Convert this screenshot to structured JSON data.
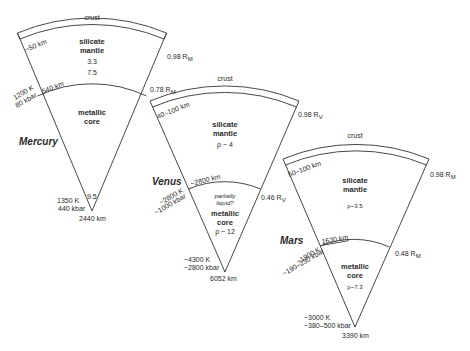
{
  "diagram": {
    "stroke_color": "#333333",
    "mercury": {
      "name": "Mercury",
      "crust_label": "crust",
      "crust_thickness": "~50 km",
      "mantle_label_1": "silicate",
      "mantle_label_2": "mantle",
      "mantle_density": "3.3",
      "core_density": "7.5",
      "mantle_core_depth": "540 km",
      "crust_radius": "0.98 R",
      "crust_radius_sub": "M",
      "core_radius": "0.78 R",
      "core_radius_sub": "M",
      "cmb_temp": "1200 K",
      "cmb_pressure": "80 kbar",
      "core_label_1": "metallic",
      "core_label_2": "core",
      "center_density": "9.5",
      "center_temp": "1350 K",
      "center_pressure": "440 kbar",
      "radius": "2440 km"
    },
    "venus": {
      "name": "Venus",
      "crust_label": "crust",
      "crust_thickness": "40–100 km",
      "crust_radius": "0.98 R",
      "crust_radius_sub": "V",
      "mantle_label_1": "silicate",
      "mantle_label_2": "mantle",
      "mantle_density": "ρ ~ 4",
      "mantle_core_depth": "~2800 km",
      "cmb_temp": "~2800 K",
      "cmb_pressure": "~1000 kbar",
      "core_radius": "0.46 R",
      "core_radius_sub": "V",
      "core_note_1": "partially",
      "core_note_2": "liquid?",
      "core_label_1": "metallic",
      "core_label_2": "core",
      "core_density": "ρ ~ 12",
      "center_temp": "~4300 K",
      "center_pressure": "~2800 kbar",
      "radius": "6052 km"
    },
    "mars": {
      "name": "Mars",
      "crust_label": "crust",
      "crust_thickness": "50–100 km",
      "crust_radius": "0.98 R",
      "crust_radius_sub": "M",
      "mantle_label_1": "silicate",
      "mantle_label_2": "mantle",
      "mantle_density": "ρ~3.5",
      "mantle_core_depth": "1630 km",
      "cmb_temp": "~1900 K",
      "cmb_pressure": "~190–230 kbar",
      "core_radius": "0.48 R",
      "core_radius_sub": "M",
      "core_label_1": "metallic",
      "core_label_2": "core",
      "core_density": "ρ~7.3",
      "center_temp": "~3000 K",
      "center_pressure": "~380–500 kbar",
      "radius": "3390 km"
    }
  }
}
